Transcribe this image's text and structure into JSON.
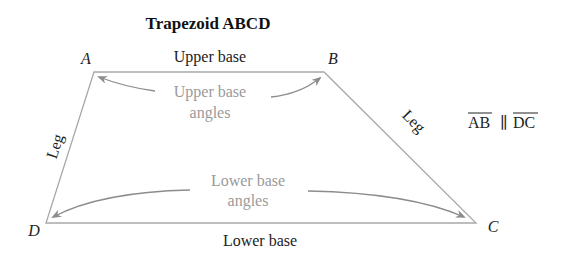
{
  "title": "Trapezoid ABCD",
  "vertices": {
    "A": "A",
    "B": "B",
    "C": "C",
    "D": "D"
  },
  "labels": {
    "upper_base": "Upper base",
    "lower_base": "Lower base",
    "left_leg": "Leg",
    "right_leg": "Leg",
    "upper_angles_line1": "Upper base",
    "upper_angles_line2": "angles",
    "lower_angles_line1": "Lower base",
    "lower_angles_line2": "angles"
  },
  "parallel": {
    "seg1": "AB",
    "symbol": "∥",
    "seg2": "DC"
  },
  "colors": {
    "line": "#a8a8a8",
    "text": "#222222",
    "annotation": "#9a9a9a",
    "arrow": "#8c8c8c"
  }
}
